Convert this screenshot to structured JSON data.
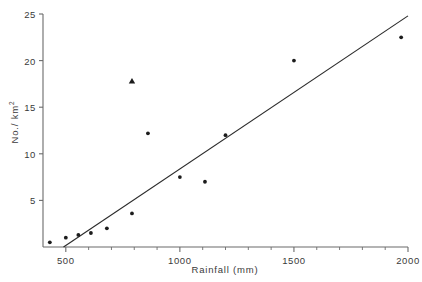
{
  "chart_data": {
    "type": "scatter",
    "title": "",
    "xlabel": "Rainfall (mm)",
    "ylabel": "No./ km²",
    "ylabel_base": "No./ km",
    "ylabel_exponent": "2",
    "xlim": [
      400,
      2000
    ],
    "ylim": [
      0,
      25
    ],
    "grid": false,
    "legend": "none",
    "x_major_ticks": [
      500,
      1000,
      1500,
      2000
    ],
    "x_major_tick_labels": [
      "500",
      "1000",
      "1500",
      "2000"
    ],
    "x_minor_ticks": [
      600,
      700,
      800,
      900,
      1100,
      1200,
      1300,
      1400,
      1600,
      1700,
      1800,
      1900
    ],
    "y_major_ticks": [
      5,
      10,
      15,
      20,
      25
    ],
    "y_major_tick_labels": [
      "5",
      "10",
      "15",
      "20",
      "25"
    ],
    "marker_color": "#1c1c1c",
    "line_color": "#2b2b2b",
    "axis_color": "#6b6b6b",
    "series": [
      {
        "name": "observations",
        "marker": "circle",
        "points": [
          {
            "x": 430,
            "y": 0.5
          },
          {
            "x": 500,
            "y": 1.0
          },
          {
            "x": 555,
            "y": 1.3
          },
          {
            "x": 610,
            "y": 1.5
          },
          {
            "x": 680,
            "y": 2.0
          },
          {
            "x": 790,
            "y": 3.6
          },
          {
            "x": 860,
            "y": 12.2
          },
          {
            "x": 1000,
            "y": 7.5
          },
          {
            "x": 1110,
            "y": 7.0
          },
          {
            "x": 1200,
            "y": 12.0
          },
          {
            "x": 1500,
            "y": 20.0
          },
          {
            "x": 1970,
            "y": 22.5
          }
        ]
      },
      {
        "name": "outlier",
        "marker": "triangle",
        "points": [
          {
            "x": 790,
            "y": 17.8
          }
        ]
      }
    ],
    "fit_line": {
      "name": "regression-line",
      "x_start": 490,
      "y_start": 0.0,
      "x_end": 2000,
      "y_end": 24.8
    }
  },
  "ticks": {
    "y": [
      "25",
      "20",
      "15",
      "10",
      "5"
    ],
    "x": [
      "500",
      "1000",
      "1500",
      "2000"
    ]
  },
  "axis_titles": {
    "x": "Rainfall (mm)",
    "y_base": "No./ km",
    "y_exp": "2"
  }
}
